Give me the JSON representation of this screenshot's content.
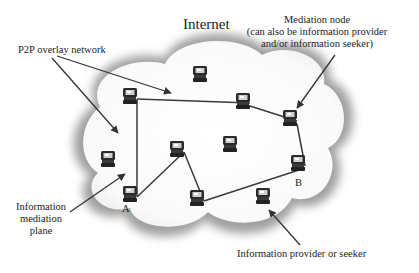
{
  "diagram": {
    "title": "Internet",
    "labels": {
      "p2p": "P2P overlay network",
      "mediation_line1": "Mediation node",
      "mediation_line2": "(can also be information provider",
      "mediation_line3": "and/or information seeker)",
      "plane_line1": "Information",
      "plane_line2": "mediation",
      "plane_line3": "plane",
      "provider": "Information provider or seeker",
      "node_a": "A",
      "node_b": "B"
    },
    "nodes": [
      {
        "id": "n1",
        "x": 130,
        "y": 95
      },
      {
        "id": "n2",
        "x": 200,
        "y": 73
      },
      {
        "id": "n3",
        "x": 243,
        "y": 100
      },
      {
        "id": "mediation",
        "x": 290,
        "y": 117
      },
      {
        "id": "n5",
        "x": 230,
        "y": 143
      },
      {
        "id": "n6",
        "x": 177,
        "y": 148
      },
      {
        "id": "n7",
        "x": 108,
        "y": 158
      },
      {
        "id": "A",
        "x": 130,
        "y": 193
      },
      {
        "id": "n9",
        "x": 197,
        "y": 197
      },
      {
        "id": "B",
        "x": 298,
        "y": 162
      },
      {
        "id": "seeker",
        "x": 263,
        "y": 195
      }
    ],
    "edges": [
      [
        "n1",
        "n3"
      ],
      [
        "n3",
        "mediation"
      ],
      [
        "mediation",
        "B"
      ],
      [
        "B",
        "n9"
      ],
      [
        "n9",
        "n6"
      ],
      [
        "n6",
        "A"
      ],
      [
        "A",
        "n1"
      ]
    ],
    "colors": {
      "ink": "#333333",
      "cloud_shadow": "#9a9a9a",
      "cloud_fill": "#ffffff"
    }
  }
}
